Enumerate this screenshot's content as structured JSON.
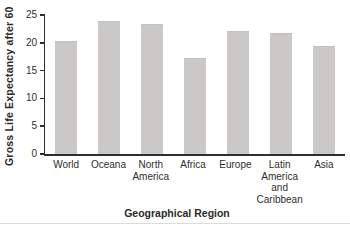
{
  "chart_data": {
    "type": "bar",
    "categories": [
      "World",
      "Oceana",
      "North America",
      "Africa",
      "Europe",
      "Latin America and Caribbean",
      "Asia"
    ],
    "values": [
      20.3,
      24.0,
      23.4,
      17.3,
      22.1,
      21.8,
      19.4
    ],
    "title": "",
    "xlabel": "Geographical Region",
    "ylabel": "Gross Life Expectancy after 60",
    "ylim": [
      0,
      25
    ],
    "yticks": [
      0,
      5,
      10,
      15,
      20,
      25
    ],
    "grid": false,
    "legend_position": "none",
    "bar_color": "#cac9c7",
    "axis_color": "#2e2e2e",
    "text_color": "#2e2e2e",
    "background_color": "#ffffff"
  }
}
